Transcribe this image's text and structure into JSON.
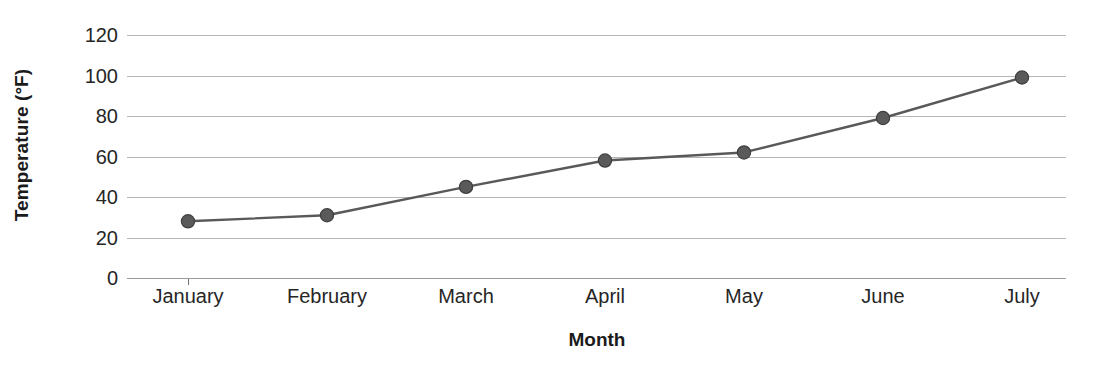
{
  "chart_data": {
    "type": "line",
    "title": "",
    "xlabel": "Month",
    "ylabel": "Temperature (°F)",
    "categories": [
      "January",
      "February",
      "March",
      "April",
      "May",
      "June",
      "July"
    ],
    "values": [
      28,
      31,
      45,
      58,
      62,
      79,
      99
    ],
    "series": [
      {
        "name": "Temperature",
        "values": [
          28,
          31,
          45,
          58,
          62,
          79,
          99
        ]
      }
    ],
    "ylim": [
      0,
      120
    ],
    "y_ticks": [
      0,
      20,
      40,
      60,
      80,
      100,
      120
    ],
    "y_tick_labels": [
      "0",
      "20",
      "40",
      "60",
      "80",
      "100",
      "120"
    ],
    "grid": "horizontal",
    "legend": "none",
    "line_color": "#595959",
    "marker_color": "#5a5a5a",
    "marker_shape": "circle",
    "gridline_color": "#b5b5b5",
    "text_color": "#262626"
  }
}
